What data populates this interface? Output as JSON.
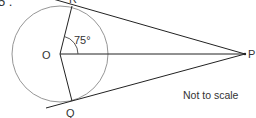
{
  "question": {
    "number_label": "5 ."
  },
  "diagram": {
    "points": {
      "O": {
        "label": "O",
        "x": 60,
        "y": 54
      },
      "R": {
        "label": "R",
        "x": 72,
        "y": 6
      },
      "Q": {
        "label": "Q",
        "x": 72,
        "y": 101
      },
      "P": {
        "label": "P",
        "x": 245,
        "y": 54
      }
    },
    "circle": {
      "center": "O",
      "radius": 48
    },
    "angle": {
      "label": "75°",
      "vertex": "O",
      "between": [
        "R",
        "P"
      ]
    },
    "note": "Not to scale",
    "colors": {
      "line": "#222222",
      "circle": "#888888",
      "text": "#333333"
    }
  }
}
